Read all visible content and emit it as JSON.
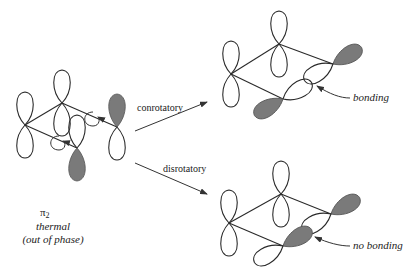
{
  "diagram": {
    "reactant": {
      "orbital": "π",
      "orbital_subscript": "2",
      "condition": "thermal",
      "phase_note": "(out of phase)"
    },
    "pathways": [
      {
        "label": "conrotatory",
        "result_label": "bonding"
      },
      {
        "label": "disrotatory",
        "result_label": "no bonding"
      }
    ],
    "colors": {
      "shaded_lobe": "#7a7a7a",
      "line": "#2a2a2a",
      "background": "#ffffff"
    }
  }
}
